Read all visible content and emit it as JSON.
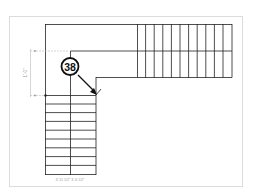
{
  "diagram": {
    "type": "stair-plan",
    "callout": {
      "number": "38"
    },
    "dimension_left": {
      "label": "1'-0\""
    },
    "bottom_labels": {
      "text": "3'-11 1/2\"  3'-6 1/2\""
    },
    "colors": {
      "line": "#222222",
      "frame": "#dcdcdc",
      "dim": "#b0b0b0"
    },
    "upper_flight": {
      "tread_lines_x": [
        137,
        145.6,
        154.2,
        162.8,
        171.4,
        180,
        188.6,
        197.2,
        205.8,
        214.4,
        223,
        232
      ]
    },
    "lower_flight": {
      "tread_lines_y": [
        95,
        103.8,
        112.6,
        121.4,
        130.2,
        139,
        147.8,
        156.6,
        165.4,
        174.2
      ]
    }
  }
}
